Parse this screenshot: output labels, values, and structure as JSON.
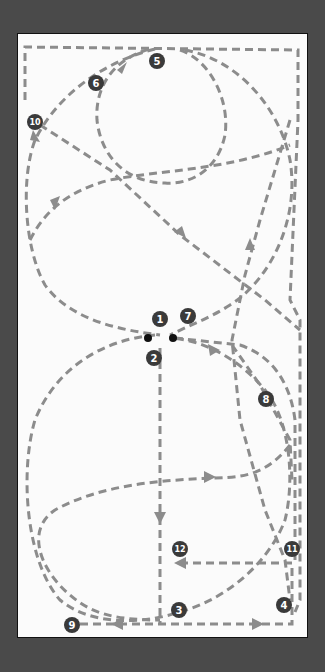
{
  "diagram": {
    "type": "movement-path-diagram",
    "colors": {
      "background": "#4a4a4a",
      "panel": "#fbfbfb",
      "path": "#8c8c8c",
      "marker": "#3a3a3a",
      "marker_text": "#ffffff",
      "dot": "#111111"
    },
    "markers": [
      {
        "label": "1",
        "x": 160,
        "y": 319
      },
      {
        "label": "2",
        "x": 154,
        "y": 358
      },
      {
        "label": "3",
        "x": 179,
        "y": 610
      },
      {
        "label": "4",
        "x": 284,
        "y": 605
      },
      {
        "label": "5",
        "x": 157,
        "y": 61
      },
      {
        "label": "6",
        "x": 96,
        "y": 83
      },
      {
        "label": "7",
        "x": 188,
        "y": 316
      },
      {
        "label": "8",
        "x": 266,
        "y": 399
      },
      {
        "label": "9",
        "x": 72,
        "y": 625
      },
      {
        "label": "10",
        "x": 35,
        "y": 122
      },
      {
        "label": "11",
        "x": 292,
        "y": 549
      },
      {
        "label": "12",
        "x": 180,
        "y": 549
      }
    ],
    "start_points": [
      {
        "x": 148,
        "y": 338
      },
      {
        "x": 173,
        "y": 338
      }
    ]
  }
}
